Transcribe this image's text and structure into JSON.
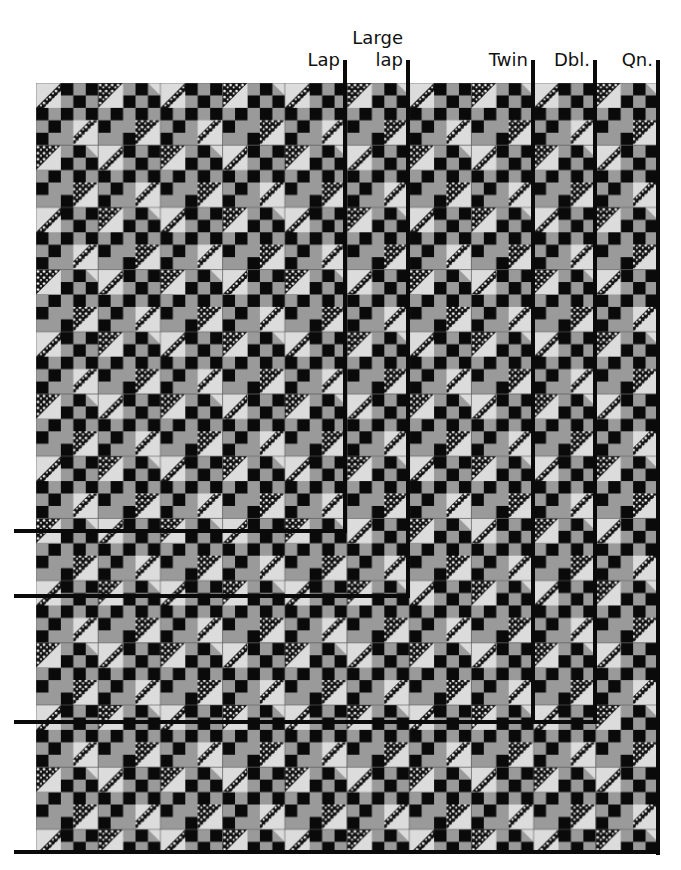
{
  "diagram": {
    "type": "quilt-size-layout",
    "grid": {
      "columns": 10,
      "rows": 12,
      "block_px": 62,
      "cells_per_block": 5
    },
    "colors": {
      "black": "#0a0a0a",
      "gray": "#9a9a9a",
      "light": "#dcdcdc",
      "print": "#111111",
      "seam": "#5a5a5a"
    },
    "size_labels": [
      {
        "id": "lap",
        "label": "Lap",
        "line1": "",
        "line2": "Lap",
        "columns": 5,
        "rows": 7
      },
      {
        "id": "large-lap",
        "label": "Large lap",
        "line1": "Large",
        "line2": "lap",
        "columns": 6,
        "rows": 8
      },
      {
        "id": "twin",
        "label": "Twin",
        "line1": "",
        "line2": "Twin",
        "columns": 8,
        "rows": 10
      },
      {
        "id": "double",
        "label": "Dbl.",
        "line1": "",
        "line2": "Dbl.",
        "columns": 9,
        "rows": 10
      },
      {
        "id": "queen",
        "label": "Qn.",
        "line1": "",
        "line2": "Qn.",
        "columns": 10,
        "rows": 12
      }
    ]
  }
}
